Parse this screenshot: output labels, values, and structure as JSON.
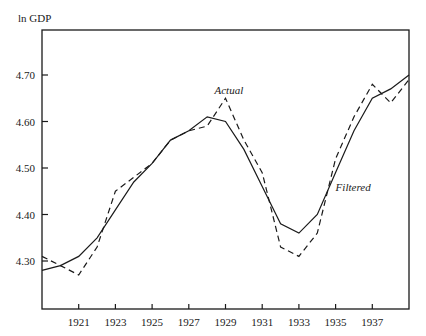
{
  "chart_data": {
    "type": "line",
    "title": "",
    "xlabel": "",
    "ylabel": "ln GDP",
    "xlim": [
      1919,
      1939
    ],
    "ylim": [
      4.2,
      4.78
    ],
    "x_ticks": [
      1921,
      1923,
      1925,
      1927,
      1929,
      1931,
      1933,
      1935,
      1937
    ],
    "x_tick_labels": [
      "1921",
      "1923",
      "1925",
      "1927",
      "1929",
      "1931",
      "1933",
      "1935",
      "1937"
    ],
    "y_ticks": [
      4.3,
      4.4,
      4.5,
      4.6,
      4.7
    ],
    "y_tick_labels": [
      "4.30",
      "4.40",
      "4.50",
      "4.60",
      "4.70"
    ],
    "grid": false,
    "legend": "inline annotations",
    "x": [
      1919,
      1920,
      1921,
      1922,
      1923,
      1924,
      1925,
      1926,
      1927,
      1928,
      1929,
      1930,
      1931,
      1932,
      1933,
      1934,
      1935,
      1936,
      1937,
      1938,
      1939
    ],
    "series": [
      {
        "name": "Actual",
        "style": "dashed",
        "values": [
          4.31,
          4.29,
          4.27,
          4.33,
          4.45,
          4.48,
          4.51,
          4.56,
          4.58,
          4.59,
          4.65,
          4.56,
          4.49,
          4.33,
          4.31,
          4.36,
          4.52,
          4.61,
          4.68,
          4.64,
          4.69
        ]
      },
      {
        "name": "Filtered",
        "style": "solid",
        "values": [
          4.28,
          4.29,
          4.31,
          4.35,
          4.41,
          4.47,
          4.51,
          4.56,
          4.58,
          4.61,
          4.6,
          4.54,
          4.46,
          4.38,
          4.36,
          4.4,
          4.49,
          4.58,
          4.65,
          4.67,
          4.7
        ]
      }
    ],
    "annotations": [
      {
        "text": "Actual",
        "x": 1929.0,
        "y": 4.66
      },
      {
        "text": "Filtered",
        "x": 1935.6,
        "y": 4.45
      }
    ]
  }
}
